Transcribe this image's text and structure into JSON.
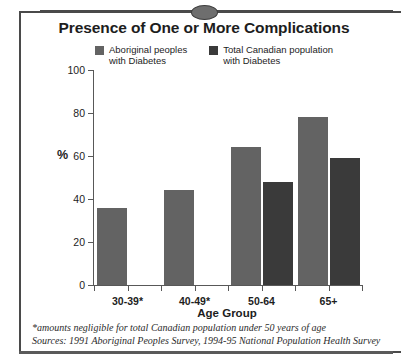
{
  "title": "Presence of One or More Complications",
  "decoration": {
    "oval_icon": "oval-ornament-icon",
    "frame_color": "#4a4a4a"
  },
  "legend": {
    "position": "top",
    "entries": [
      {
        "label": "Aboriginal peoples\nwith Diabetes",
        "color": "#636363"
      },
      {
        "label": "Total Canadian population\nwith Diabetes",
        "color": "#3a3a3a"
      }
    ]
  },
  "axes": {
    "ylabel": "%",
    "xlabel": "Age Group",
    "yticks": [
      0,
      20,
      40,
      60,
      80,
      100
    ],
    "ylim": [
      0,
      100
    ]
  },
  "footnotes": [
    "*amounts negligible for total Canadian population under 50 years of age",
    "Sources: 1991 Aboriginal Peoples Survey, 1994-95 National Population Health Survey"
  ],
  "chart_data": {
    "type": "bar",
    "title": "Presence of One or More Complications",
    "xlabel": "Age Group",
    "ylabel": "%",
    "ylim": [
      0,
      100
    ],
    "yticks": [
      0,
      20,
      40,
      60,
      80,
      100
    ],
    "grid": false,
    "legend_position": "top",
    "categories": [
      "30-39*",
      "40-49*",
      "50-64",
      "65+"
    ],
    "series": [
      {
        "name": "Aboriginal peoples with Diabetes",
        "color": "#636363",
        "values": [
          36,
          44,
          64,
          78
        ]
      },
      {
        "name": "Total Canadian population with Diabetes",
        "color": "#3a3a3a",
        "values": [
          null,
          null,
          48,
          59
        ]
      }
    ],
    "annotations": [
      "*amounts negligible for total Canadian population under 50 years of age",
      "Sources: 1991 Aboriginal Peoples Survey, 1994-95 National Population Health Survey"
    ]
  }
}
